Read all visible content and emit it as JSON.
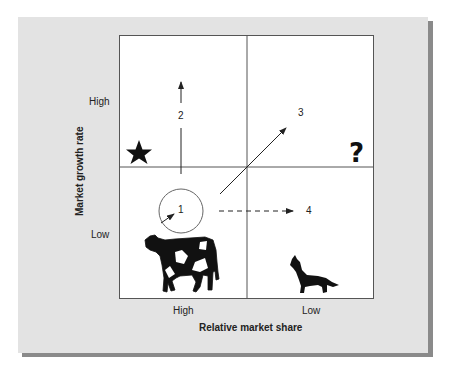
{
  "diagram": {
    "type": "BCG growth-share matrix",
    "y_axis": {
      "title": "Market growth rate",
      "high": "High",
      "low": "Low"
    },
    "x_axis": {
      "title": "Relative market share",
      "high": "High",
      "low": "Low"
    },
    "quadrants": [
      {
        "position": "top-left",
        "symbol": "star-icon",
        "glyph": "★"
      },
      {
        "position": "top-right",
        "symbol": "question-mark-icon",
        "glyph": "?"
      },
      {
        "position": "bottom-left",
        "symbol": "cow-icon"
      },
      {
        "position": "bottom-right",
        "symbol": "dog-icon"
      }
    ],
    "arrows": [
      {
        "label": "1",
        "style": "solid",
        "note": "small arrow inside circle"
      },
      {
        "label": "2",
        "style": "solid",
        "direction": "up"
      },
      {
        "label": "3",
        "style": "solid",
        "direction": "up-right diagonal"
      },
      {
        "label": "4",
        "style": "dashed",
        "direction": "right"
      }
    ],
    "colors": {
      "panel": "#e3e3e3",
      "shadow": "#8a8a8a",
      "matrix_bg": "#ffffff",
      "lines": "#555555",
      "ink": "#111111"
    }
  }
}
